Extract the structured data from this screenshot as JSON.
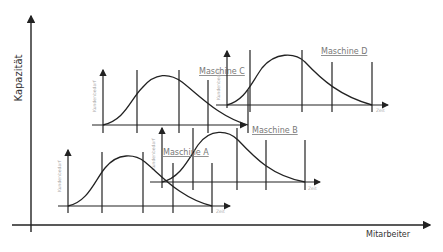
{
  "axes": {
    "y_label": "Kapazität",
    "x_label": "Mitarbeiter"
  },
  "graph_common": {
    "y_label": "Kundenbedarf",
    "x_label": "Zeit"
  },
  "machines": [
    {
      "label": "Maschine A"
    },
    {
      "label": "Maschine B"
    },
    {
      "label": "Maschine C"
    },
    {
      "label": "Maschine D"
    }
  ],
  "colors": {
    "line": "#222222",
    "label": "#777777",
    "tiny": "#aaaaaa"
  }
}
